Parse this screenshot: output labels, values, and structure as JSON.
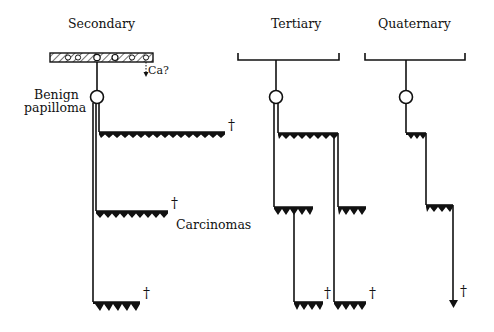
{
  "headings": {
    "secondary": "Secondary",
    "tertiary": "Tertiary",
    "quaternary": "Quaternary"
  },
  "labels": {
    "benign_line1": "Benign",
    "benign_line2": "papilloma",
    "carcinomas": "Carcinomas",
    "ca_query": "Ca?"
  },
  "death_marker": "†",
  "colors": {
    "ink": "#111111",
    "background": "#ffffff"
  }
}
